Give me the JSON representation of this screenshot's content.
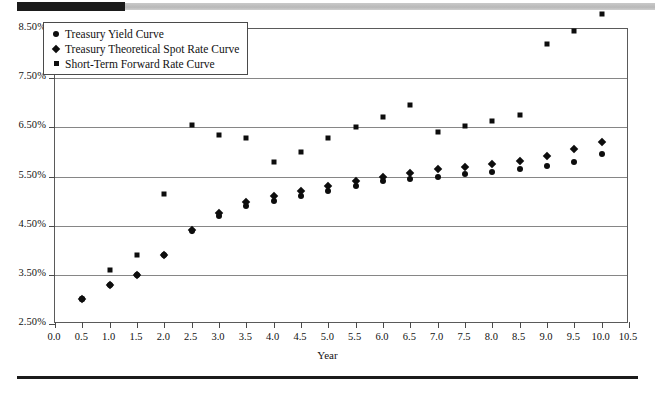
{
  "decor": {
    "top_bar_dark_color": "#1b1b1b",
    "top_bar_gray_color": "#c4c4c4",
    "bottom_rule_color": "#1b1b1b"
  },
  "legend": {
    "position": "top-left-inside",
    "entries": [
      {
        "marker": "circle",
        "label": "Treasury Yield Curve"
      },
      {
        "marker": "diamond",
        "label": "Treasury Theoretical Spot Rate Curve"
      },
      {
        "marker": "square",
        "label": "Short-Term Forward Rate Curve"
      }
    ]
  },
  "chart_data": {
    "type": "scatter",
    "title": "",
    "xlabel": "Year",
    "ylabel": "",
    "xlim": [
      0.0,
      10.5
    ],
    "ylim": [
      2.5,
      8.5
    ],
    "grid": true,
    "marker_color": "#0d0d0d",
    "x_ticks": [
      "0.0",
      "0.5",
      "1.0",
      "1.5",
      "2.0",
      "2.5",
      "3.0",
      "3.5",
      "4.0",
      "4.5",
      "5.0",
      "5.5",
      "6.0",
      "6.5",
      "7.0",
      "7.5",
      "8.0",
      "8.5",
      "9.0",
      "9.5",
      "10.0",
      "10.5"
    ],
    "x_tick_values": [
      0.0,
      0.5,
      1.0,
      1.5,
      2.0,
      2.5,
      3.0,
      3.5,
      4.0,
      4.5,
      5.0,
      5.5,
      6.0,
      6.5,
      7.0,
      7.5,
      8.0,
      8.5,
      9.0,
      9.5,
      10.0,
      10.5
    ],
    "y_ticks": [
      "2.50%",
      "3.50%",
      "4.50%",
      "5.50%",
      "6.50%",
      "7.50%",
      "8.50%"
    ],
    "y_tick_values": [
      2.5,
      3.5,
      4.5,
      5.5,
      6.5,
      7.5,
      8.5
    ],
    "x": [
      0.5,
      1.0,
      1.5,
      2.0,
      2.5,
      3.0,
      3.5,
      4.0,
      4.5,
      5.0,
      5.5,
      6.0,
      6.5,
      7.0,
      7.5,
      8.0,
      8.5,
      9.0,
      9.5,
      10.0
    ],
    "series": [
      {
        "name": "Treasury Yield Curve",
        "marker": "circle",
        "values": [
          3.0,
          3.3,
          3.5,
          3.9,
          4.4,
          4.7,
          4.9,
          5.0,
          5.1,
          5.2,
          5.3,
          5.4,
          5.45,
          5.5,
          5.55,
          5.6,
          5.65,
          5.72,
          5.8,
          5.95
        ]
      },
      {
        "name": "Treasury Theoretical Spot Rate Curve",
        "marker": "diamond",
        "values": [
          3.0,
          3.3,
          3.5,
          3.9,
          4.42,
          4.75,
          4.98,
          5.1,
          5.2,
          5.3,
          5.4,
          5.5,
          5.58,
          5.65,
          5.7,
          5.75,
          5.82,
          5.92,
          6.05,
          6.2
        ]
      },
      {
        "name": "Short-Term Forward Rate Curve",
        "marker": "square",
        "values": [
          3.0,
          3.6,
          3.9,
          5.15,
          6.55,
          6.35,
          6.28,
          5.8,
          6.0,
          6.28,
          6.5,
          6.72,
          6.95,
          6.4,
          6.52,
          6.62,
          6.75,
          8.2,
          8.45,
          8.8
        ]
      }
    ]
  }
}
